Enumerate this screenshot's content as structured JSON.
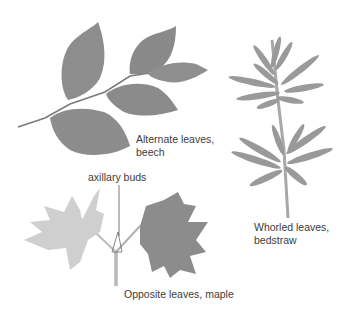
{
  "figure": {
    "panels": [
      {
        "id": "alternate",
        "label_line1": "Alternate leaves,",
        "label_line2": "beech",
        "leaf_color": "#8e8e8e",
        "stem_color": "#7a7a7a"
      },
      {
        "id": "whorled",
        "label_line1": "Whorled leaves,",
        "label_line2": "bedstraw",
        "leaf_color": "#9a9a9a",
        "stem_color": "#a8a8a8"
      },
      {
        "id": "opposite",
        "label": "Opposite leaves, maple",
        "callout": "axillary buds",
        "left_leaf_color": "#cfcfcf",
        "right_leaf_color": "#8c8c8c",
        "stem_color": "#b9b9b9"
      }
    ]
  }
}
